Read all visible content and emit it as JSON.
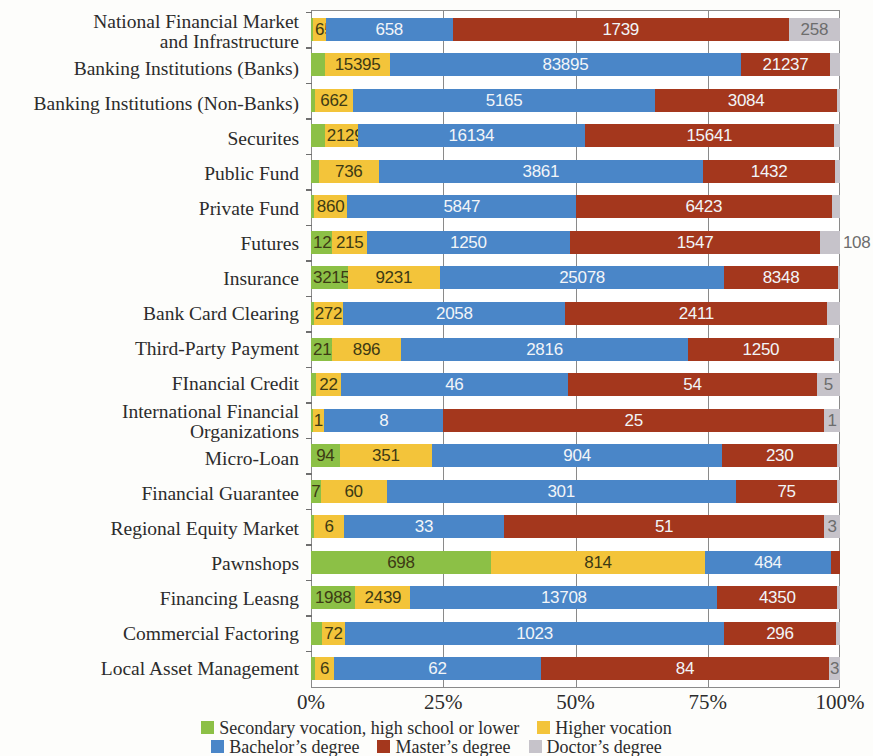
{
  "chart_data": {
    "type": "bar",
    "title": "",
    "subtitle": "",
    "xlabel": "",
    "ylabel": "",
    "orientation": "horizontal",
    "stacked": "100%",
    "grid": true,
    "xlim": [
      0,
      100
    ],
    "xticks": [
      "0%",
      "25%",
      "50%",
      "75%",
      "100%"
    ],
    "legend_position": "bottom",
    "colors": {
      "secondary": "#8cc046",
      "higher_vocation": "#f3c43a",
      "bachelor": "#4a86c8",
      "master": "#a4371d",
      "doctor": "#c6c3ca"
    },
    "series": [
      {
        "name": "Secondary vocation, high school or lower",
        "color": "#8cc046"
      },
      {
        "name": "Higher vocation",
        "color": "#f3c43a"
      },
      {
        "name": "Bachelor’s degree",
        "color": "#4a86c8"
      },
      {
        "name": "Master’s degree",
        "color": "#a4371d"
      },
      {
        "name": "Doctor’s degree",
        "color": "#c6c3ca"
      }
    ],
    "categories": [
      "National Financial Market and Infrastructure",
      "Banking Institutions (Banks)",
      "Banking Institutions (Non-Banks)",
      "Securites",
      "Public Fund",
      "Private Fund",
      "Futures",
      "Insurance",
      "Bank Card Clearing",
      "Third-Party Payment",
      "FInancial Credit",
      "International Financial Organizations",
      "Micro-Loan",
      "Financial Guarantee",
      "Regional Equity Market",
      "Pawnshops",
      "Financing Leasng",
      "Commercial Factoring",
      "Local Asset Management"
    ],
    "rows": [
      {
        "category": "National Financial Market and Infrastructure",
        "label_lines": [
          "National Financial Market",
          "and Infrastructure"
        ],
        "values": [
          10,
          65,
          658,
          1739,
          258
        ],
        "labels": [
          "",
          "65",
          "658",
          "1739",
          "258"
        ],
        "pct": [
          0.4,
          2.4,
          24.0,
          63.5,
          9.7
        ]
      },
      {
        "category": "Banking Institutions (Banks)",
        "label_lines": [
          "Banking Institutions (Banks)"
        ],
        "values": [
          3400,
          15395,
          83895,
          21237,
          700
        ],
        "labels": [
          "",
          "15395",
          "83895",
          "21237",
          ""
        ],
        "pct": [
          2.7,
          12.2,
          66.4,
          16.8,
          1.9
        ]
      },
      {
        "category": "Banking Institutions (Non-Banks)",
        "label_lines": [
          "Banking Institutions (Non-Banks)"
        ],
        "values": [
          60,
          662,
          5165,
          3084,
          40
        ],
        "labels": [
          "",
          "662",
          "5165",
          "3084",
          ""
        ],
        "pct": [
          0.7,
          7.3,
          57.0,
          34.5,
          0.5
        ]
      },
      {
        "category": "Securites",
        "label_lines": [
          "Securites"
        ],
        "values": [
          900,
          2129,
          16134,
          15641,
          400
        ],
        "labels": [
          "",
          "2129",
          "16134",
          "15641",
          ""
        ],
        "pct": [
          2.6,
          6.2,
          43.0,
          47.0,
          1.2
        ]
      },
      {
        "category": "Public Fund",
        "label_lines": [
          "Public Fund"
        ],
        "values": [
          90,
          736,
          3861,
          1432,
          50
        ],
        "labels": [
          "",
          "736",
          "3861",
          "1432",
          ""
        ],
        "pct": [
          1.5,
          11.3,
          61.3,
          25.0,
          0.9
        ]
      },
      {
        "category": "Private Fund",
        "label_lines": [
          "Private Fund"
        ],
        "values": [
          70,
          860,
          5847,
          6423,
          180
        ],
        "labels": [
          "",
          "860",
          "5847",
          "6423",
          ""
        ],
        "pct": [
          0.5,
          6.4,
          43.2,
          48.3,
          1.6
        ]
      },
      {
        "category": "Futures",
        "label_lines": [
          "Futures"
        ],
        "values": [
          129,
          215,
          1250,
          1547,
          108
        ],
        "labels": [
          "129",
          "215",
          "1250",
          "1547",
          "108"
        ],
        "pct": [
          4.0,
          6.6,
          38.3,
          47.4,
          3.7
        ]
      },
      {
        "category": "Insurance",
        "label_lines": [
          "Insurance"
        ],
        "values": [
          3215,
          9231,
          25078,
          8348,
          150
        ],
        "labels": [
          "3215",
          "9231",
          "25078",
          "8348",
          ""
        ],
        "pct": [
          6.9,
          17.5,
          53.7,
          21.5,
          0.4
        ]
      },
      {
        "category": "Bank Card Clearing",
        "label_lines": [
          "Bank Card Clearing"
        ],
        "values": [
          30,
          272,
          2058,
          2411,
          120
        ],
        "labels": [
          "",
          "272",
          "2058",
          "2411",
          ""
        ],
        "pct": [
          0.5,
          5.6,
          42.0,
          49.5,
          2.4
        ]
      },
      {
        "category": "Third-Party Payment",
        "label_lines": [
          "Third-Party Payment"
        ],
        "values": [
          213,
          896,
          2816,
          1250,
          60
        ],
        "labels": [
          "213",
          "896",
          "2816",
          "1250",
          ""
        ],
        "pct": [
          4.0,
          13.0,
          54.3,
          27.5,
          1.2
        ]
      },
      {
        "category": "FInancial Credit",
        "label_lines": [
          "FInancial Credit"
        ],
        "values": [
          3,
          22,
          46,
          54,
          5
        ],
        "labels": [
          "",
          "22",
          "46",
          "54",
          "5"
        ],
        "pct": [
          1.0,
          4.6,
          43.0,
          47.0,
          4.4
        ]
      },
      {
        "category": "International Financial Organizations",
        "label_lines": [
          "International Financial",
          "Organizations"
        ],
        "values": [
          0,
          1,
          8,
          25,
          1
        ],
        "labels": [
          "",
          "1",
          "8",
          "25",
          "1"
        ],
        "pct": [
          0.3,
          2.2,
          22.5,
          72.0,
          3.0
        ]
      },
      {
        "category": "Micro-Loan",
        "label_lines": [
          "Micro-Loan"
        ],
        "values": [
          94,
          351,
          904,
          230,
          10
        ],
        "labels": [
          "94",
          "351",
          "904",
          "230",
          ""
        ],
        "pct": [
          5.4,
          17.5,
          54.8,
          21.8,
          0.5
        ]
      },
      {
        "category": "Financial Guarantee",
        "label_lines": [
          "Financial Guarantee"
        ],
        "values": [
          7,
          60,
          301,
          75,
          3
        ],
        "labels": [
          "7",
          "60",
          "301",
          "75",
          ""
        ],
        "pct": [
          1.8,
          12.5,
          66.0,
          19.2,
          0.5
        ]
      },
      {
        "category": "Regional Equity Market",
        "label_lines": [
          "Regional Equity Market"
        ],
        "values": [
          2,
          6,
          33,
          51,
          3
        ],
        "labels": [
          "",
          "6",
          "33",
          "51",
          "3"
        ],
        "pct": [
          0.6,
          5.6,
          30.3,
          60.5,
          3.0
        ]
      },
      {
        "category": "Pawnshops",
        "label_lines": [
          "Pawnshops"
        ],
        "values": [
          698,
          814,
          484,
          30,
          0
        ],
        "labels": [
          "698",
          "814",
          "484",
          "",
          ""
        ],
        "pct": [
          34.0,
          40.5,
          23.8,
          1.7,
          0.0
        ]
      },
      {
        "category": "Financing Leasng",
        "label_lines": [
          "Financing Leasng"
        ],
        "values": [
          1988,
          2439,
          13708,
          4350,
          100
        ],
        "labels": [
          "1988",
          "2439",
          "13708",
          "4350",
          ""
        ],
        "pct": [
          8.4,
          10.4,
          58.0,
          22.7,
          0.5
        ]
      },
      {
        "category": "Commercial Factoring",
        "label_lines": [
          "Commercial Factoring"
        ],
        "values": [
          28,
          72,
          1023,
          296,
          10
        ],
        "labels": [
          "",
          "72",
          "1023",
          "296",
          ""
        ],
        "pct": [
          2.0,
          4.5,
          71.5,
          21.3,
          0.7
        ]
      },
      {
        "category": "Local Asset Management",
        "label_lines": [
          "Local Asset Management"
        ],
        "values": [
          2,
          6,
          62,
          84,
          3
        ],
        "labels": [
          "",
          "6",
          "62",
          "84",
          "3"
        ],
        "pct": [
          0.7,
          3.7,
          39.0,
          54.6,
          2.0
        ]
      }
    ]
  },
  "legend": {
    "row1": [
      {
        "label": "Secondary vocation, high school or lower",
        "color": "#8cc046",
        "swatch": "legend-swatch-secondary"
      },
      {
        "label": "Higher vocation",
        "color": "#f3c43a",
        "swatch": "legend-swatch-higher-vocation"
      }
    ],
    "row2": [
      {
        "label": "Bachelor’s degree",
        "color": "#4a86c8",
        "swatch": "legend-swatch-bachelor"
      },
      {
        "label": "Master’s degree",
        "color": "#a4371d",
        "swatch": "legend-swatch-master"
      },
      {
        "label": "Doctor’s degree",
        "color": "#c6c3ca",
        "swatch": "legend-swatch-doctor"
      }
    ]
  },
  "xaxis": {
    "ticks": [
      {
        "label": "0%",
        "pos": 0
      },
      {
        "label": "25%",
        "pos": 25
      },
      {
        "label": "50%",
        "pos": 50
      },
      {
        "label": "75%",
        "pos": 75
      },
      {
        "label": "100%",
        "pos": 100
      }
    ]
  }
}
